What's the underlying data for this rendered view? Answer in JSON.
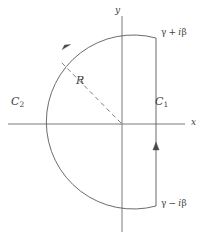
{
  "figure": {
    "name": "bromwich-contour",
    "background": "#ffffff",
    "stroke_color": "#5a5a5a",
    "text_color": "#3f3f3f",
    "axes": {
      "x_label": "x",
      "y_label": "y",
      "origin": {
        "x": 122,
        "y": 124
      },
      "x_axis": {
        "x1": 8,
        "y1": 124,
        "x2": 185,
        "y2": 124
      },
      "y_axis": {
        "x1": 122,
        "y1": 16,
        "x2": 122,
        "y2": 232
      }
    },
    "contours": [
      {
        "id": "c1",
        "label": "C",
        "subscript": "1",
        "type": "vertical-line",
        "x": 156,
        "y_top": 38,
        "y_bottom": 206,
        "direction": "upward",
        "arrow_at": {
          "x": 156,
          "y": 148
        }
      },
      {
        "id": "c2",
        "label": "C",
        "subscript": "2",
        "type": "circular-arc",
        "center": {
          "x": 122,
          "y": 124
        },
        "radius": 87,
        "start": {
          "x": 156,
          "y": 38
        },
        "end": {
          "x": 156,
          "y": 206
        },
        "sweep": "counterclockwise-major",
        "direction": "counterclockwise",
        "arrow_at": {
          "x": 66,
          "y": 47
        }
      }
    ],
    "radius_line": {
      "label": "R",
      "style": "dashed",
      "from": {
        "x": 122,
        "y": 124
      },
      "to": {
        "x": 60,
        "y": 61
      }
    },
    "endpoints": [
      {
        "id": "upper",
        "text": "γ + iβ",
        "gamma": "γ",
        "sign": "+",
        "i": "i",
        "beta": "β",
        "at": {
          "x": 156,
          "y": 38
        }
      },
      {
        "id": "lower",
        "text": "γ − iβ",
        "gamma": "γ",
        "sign": "−",
        "i": "i",
        "beta": "β",
        "at": {
          "x": 156,
          "y": 206
        }
      }
    ]
  }
}
